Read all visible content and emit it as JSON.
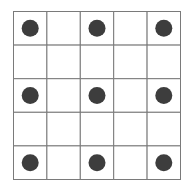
{
  "diagram": {
    "type": "dot-grid",
    "rows": 5,
    "cols": 5,
    "grid_color": "#7a7a7a",
    "dot_color": "#3d3d3d",
    "background": "#ffffff",
    "dots": [
      {
        "row": 0,
        "col": 0
      },
      {
        "row": 0,
        "col": 2
      },
      {
        "row": 0,
        "col": 4
      },
      {
        "row": 2,
        "col": 0
      },
      {
        "row": 2,
        "col": 2
      },
      {
        "row": 2,
        "col": 4
      },
      {
        "row": 4,
        "col": 0
      },
      {
        "row": 4,
        "col": 2
      },
      {
        "row": 4,
        "col": 4
      }
    ]
  }
}
